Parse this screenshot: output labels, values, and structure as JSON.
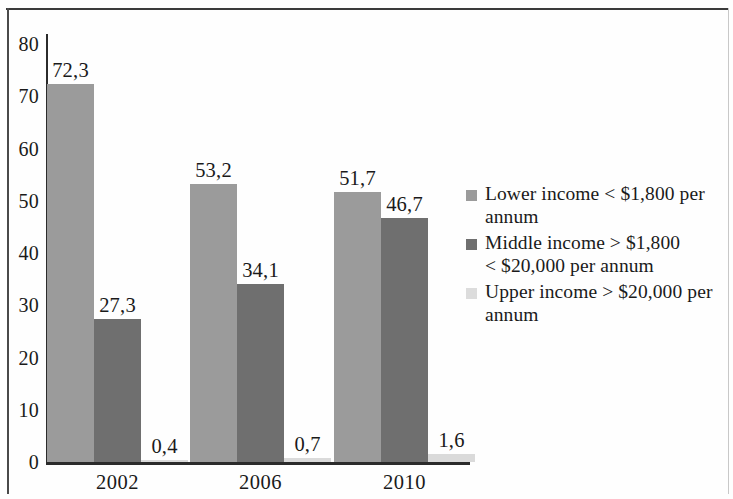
{
  "chart_data": {
    "type": "bar",
    "title": "",
    "subtitle": "",
    "xlabel": "",
    "ylabel": "",
    "categories": [
      "2002",
      "2006",
      "2010"
    ],
    "ylim": [
      0,
      80
    ],
    "yticks": [
      "0",
      "10",
      "20",
      "30",
      "40",
      "50",
      "60",
      "70",
      "80"
    ],
    "ytick_values": [
      0,
      10,
      20,
      30,
      40,
      50,
      60,
      70,
      80
    ],
    "grid": false,
    "legend_position": "right",
    "decimal_separator": ",",
    "series": [
      {
        "name": "Lower income < $1,800 per annum",
        "color": "#9b9b9b",
        "values": [
          72.3,
          53.2,
          51.7
        ],
        "labels": [
          "72,3",
          "53,2",
          "51,7"
        ]
      },
      {
        "name": "Middle income > $1,800 < $20,000 per annum",
        "color": "#6f6f6f",
        "values": [
          27.3,
          34.1,
          46.7
        ],
        "labels": [
          "27,3",
          "34,1",
          "46,7"
        ]
      },
      {
        "name": "Upper income > $20,000 per annum",
        "color": "#dcdcdc",
        "values": [
          0.4,
          0.7,
          1.6
        ],
        "labels": [
          "0,4",
          "0,7",
          "1,6"
        ]
      }
    ]
  },
  "legend": {
    "items": [
      {
        "label": "Lower income < $1,800 per\nannum",
        "color": "#9b9b9b"
      },
      {
        "label": "Middle income > $1,800\n< $20,000 per annum",
        "color": "#6f6f6f"
      },
      {
        "label": "Upper income > $20,000 per\nannum",
        "color": "#dcdcdc"
      }
    ]
  }
}
